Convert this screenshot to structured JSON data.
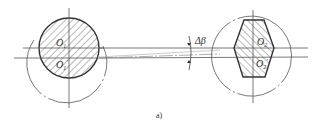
{
  "figure": {
    "caption": "a)",
    "angle_label": "Δβ",
    "left_part": {
      "labels": [
        "O1",
        "O1'"
      ],
      "label_main": "O",
      "label_sub_1": "1",
      "label_sub_2": "1",
      "label_prime": "'",
      "shape": "hatched-circle"
    },
    "right_part": {
      "labels": [
        "O2",
        "O2'"
      ],
      "label_main": "O",
      "label_sub_1": "2",
      "label_sub_2": "2",
      "label_prime": "'",
      "shape": "hatched-hexagon"
    },
    "colors": {
      "line": "#333333",
      "background": "#ffffff"
    }
  }
}
